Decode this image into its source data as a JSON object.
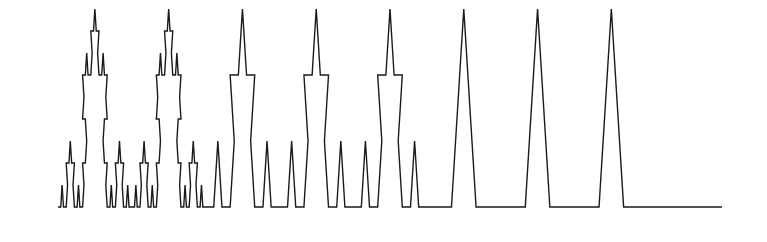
{
  "figure": {
    "kind": "koch-curve",
    "background_color": "#ffffff",
    "stroke_color": "#1a1a1a",
    "stroke_width": 1.4,
    "canvas": {
      "width": 767,
      "height": 242
    },
    "baseline_y": 207,
    "x_start": 58,
    "x_end": 722,
    "span_width": 664,
    "levels": [
      {
        "name": "level-4-fine",
        "segment_length": 12.3,
        "peak_height": 19,
        "x_from": 58,
        "x_to": 203
      },
      {
        "name": "level-3",
        "segment_length": 24.6,
        "peak_height": 43,
        "x_from": 203,
        "x_to": 277
      },
      {
        "name": "level-2",
        "segment_length": 36.9,
        "peak_height": 64,
        "x_from": 277,
        "x_to": 351
      },
      {
        "name": "level-1-coarse",
        "segment_length": 73.8,
        "peak_height": 128,
        "x_from": 351,
        "x_to": 722
      }
    ],
    "key_vertices": [
      {
        "name": "left-endpoint",
        "x": 58,
        "y": 207
      },
      {
        "name": "smallest-peak-apex",
        "x": 93,
        "y": 188
      },
      {
        "name": "mid-left-peak-apex",
        "x": 168,
        "y": 138
      },
      {
        "name": "mid-peak-apex",
        "x": 325,
        "y": 50
      },
      {
        "name": "tallest-peak-apex",
        "x": 388,
        "y": 9
      },
      {
        "name": "right-notch-vertex",
        "x": 464,
        "y": 142
      },
      {
        "name": "right-peak-apex",
        "x": 608,
        "y": 142
      },
      {
        "name": "right-endpoint",
        "x": 722,
        "y": 207
      }
    ],
    "polyline_points": "58,207 82,207 94,186 106,207 131,207 143,186 131,165 143,144 168,144 180,123 192,144 217,144 229,165 217,186 229,207 254,207 266,186 254,165 266,144 291,144 303,165 291,186 303,207 327,207 339,186 327,165 339,144 327,123 339,102 327,81 339,60 364,60 376,39 388,18 388,18 376,39 364,60 339,60 339,60 327,81 339,102 327,123 339,144 327,165 339,186 327,207",
    "path_d": "M 58 207 L 82.6 207 L 94.9 185.7 L 107.2 207 L 131.8 207 L 144.1 185.7 L 131.8 164.4 L 144.1 143.1 L 168.7 143.1 L 181 121.8 L 193.3 143.1 L 217.9 143.1 L 230.2 164.4 L 217.9 185.7 L 230.2 207 L 254.8 207 L 267.1 185.7 L 254.8 164.4 L 267.1 143.1 L 291.7 143.1 L 304 164.4 L 291.7 185.7 L 304 207 L 328.6 207 L 340.9 185.7 L 328.6 164.4 L 340.9 143.1 L 328.6 121.8 L 340.9 100.5 L 328.6 79.2 L 340.9 57.9 L 365.5 57.9 L 377.8 36.6 L 390.1 57.9 L 414.7 57.9 L 427 79.2 L 414.7 100.5 L 427 121.8 L 451.6 121.8 L 463.9 143.1 L 451.6 164.4 L 463.9 185.7 L 476.2 207 L 500.8 207 L 513.1 185.7 L 500.8 164.4 L 513.1 143.1 L 537.7 143.1 L 550 164.4 L 537.7 185.7 L 550 207 L 722 207",
    "labels": {
      "caption": "",
      "axis_labels": [],
      "annotations": []
    }
  }
}
